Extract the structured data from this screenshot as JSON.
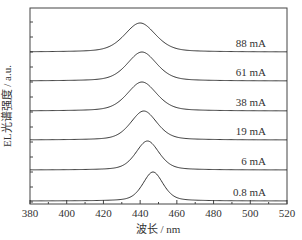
{
  "chart_data": {
    "type": "line",
    "title": "",
    "xlabel": "波长 / nm",
    "ylabel": "EL光谱强度 / a.u.",
    "xlim": [
      380,
      520
    ],
    "xticks": [
      380,
      400,
      420,
      440,
      460,
      480,
      500,
      520
    ],
    "yticks_labeled": false,
    "grid": false,
    "legend": "inline labels at right of each curve",
    "stacked_offset": true,
    "series": [
      {
        "name": "88 mA",
        "peak_nm": 440,
        "fwhm_nm": 20,
        "relative_height": 1.0
      },
      {
        "name": "61 mA",
        "peak_nm": 441,
        "fwhm_nm": 19,
        "relative_height": 1.0
      },
      {
        "name": "38 mA",
        "peak_nm": 441,
        "fwhm_nm": 19,
        "relative_height": 1.0
      },
      {
        "name": "19 mA",
        "peak_nm": 442,
        "fwhm_nm": 17,
        "relative_height": 1.0
      },
      {
        "name": "6 mA",
        "peak_nm": 444,
        "fwhm_nm": 15,
        "relative_height": 1.0
      },
      {
        "name": "0.8 mA",
        "peak_nm": 447,
        "fwhm_nm": 13,
        "relative_height": 1.0
      }
    ]
  },
  "labels": {
    "xlabel": "波长 / nm",
    "ylabel": "EL光谱强度 / a.u.",
    "series": [
      "88 mA",
      "61 mA",
      "38 mA",
      "19 mA",
      "6 mA",
      "0.8 mA"
    ],
    "xticks": [
      "380",
      "400",
      "420",
      "440",
      "460",
      "480",
      "500",
      "520"
    ]
  }
}
